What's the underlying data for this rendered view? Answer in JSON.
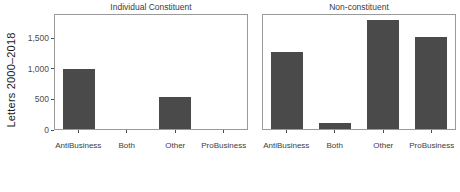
{
  "chart_data": {
    "type": "bar",
    "title": "",
    "xlabel": "",
    "ylabel": "Letters 2000–2018",
    "ylim": [
      0,
      1900
    ],
    "grid": false,
    "legend": "none",
    "bar_color": "#4a4a4a",
    "panel_border_color": "#9a9a9a",
    "axis_text_color": "#4d4d4d",
    "categories": [
      "AntiBusiness",
      "Both",
      "Other",
      "ProBusiness"
    ],
    "yticks": [
      {
        "value": 0,
        "label": "0"
      },
      {
        "value": 500,
        "label": "500"
      },
      {
        "value": 1000,
        "label": "1,000"
      },
      {
        "value": 1500,
        "label": "1,500"
      }
    ],
    "facets": [
      {
        "title": "Individual Constituent",
        "values": [
          1000,
          0,
          530,
          0
        ]
      },
      {
        "title": "Non-constituent",
        "values": [
          1290,
          100,
          1810,
          1540
        ]
      }
    ]
  }
}
